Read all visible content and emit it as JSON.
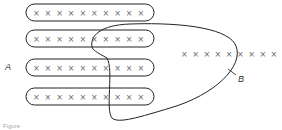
{
  "diagram": {
    "labels": {
      "set_a": "A",
      "set_b": "B"
    },
    "rows": [
      {
        "count": 10,
        "glyph": "×"
      },
      {
        "count": 10,
        "glyph": "×"
      },
      {
        "count": 10,
        "glyph": "×"
      },
      {
        "count": 10,
        "glyph": "×"
      }
    ],
    "outside_row": {
      "count": 9,
      "glyph": "×",
      "inside_b": 6,
      "outside_b": 3
    },
    "caption": "Figure"
  }
}
